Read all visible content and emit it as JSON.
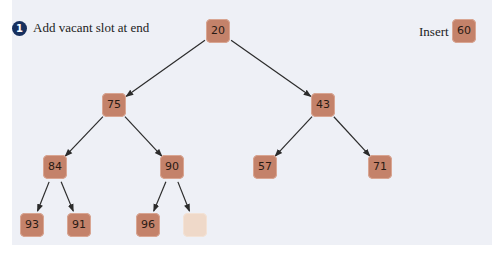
{
  "step": {
    "number": "1",
    "text": "Add vacant slot at end"
  },
  "insert": {
    "label": "Insert",
    "value": "60"
  },
  "colors": {
    "node": "#c4826a",
    "vacant": "#efd9c9",
    "panel": "#eef0f6",
    "badge": "#17305f",
    "edge": "#2b2b2b"
  },
  "tree": {
    "nodes": [
      {
        "id": "n0",
        "value": "20",
        "x": 218,
        "y": 31
      },
      {
        "id": "n1",
        "value": "75",
        "x": 114,
        "y": 105
      },
      {
        "id": "n2",
        "value": "43",
        "x": 323,
        "y": 105
      },
      {
        "id": "n3",
        "value": "84",
        "x": 55,
        "y": 167
      },
      {
        "id": "n4",
        "value": "90",
        "x": 172,
        "y": 167
      },
      {
        "id": "n5",
        "value": "57",
        "x": 265,
        "y": 167
      },
      {
        "id": "n6",
        "value": "71",
        "x": 380,
        "y": 167
      },
      {
        "id": "n7",
        "value": "93",
        "x": 32,
        "y": 225
      },
      {
        "id": "n8",
        "value": "91",
        "x": 79,
        "y": 225
      },
      {
        "id": "n9",
        "value": "96",
        "x": 148,
        "y": 225
      },
      {
        "id": "n10",
        "value": "",
        "x": 195,
        "y": 225,
        "vacant": true
      }
    ],
    "edges": [
      [
        "n0",
        "n1"
      ],
      [
        "n0",
        "n2"
      ],
      [
        "n1",
        "n3"
      ],
      [
        "n1",
        "n4"
      ],
      [
        "n2",
        "n5"
      ],
      [
        "n2",
        "n6"
      ],
      [
        "n3",
        "n7"
      ],
      [
        "n3",
        "n8"
      ],
      [
        "n4",
        "n9"
      ],
      [
        "n4",
        "n10"
      ]
    ]
  }
}
